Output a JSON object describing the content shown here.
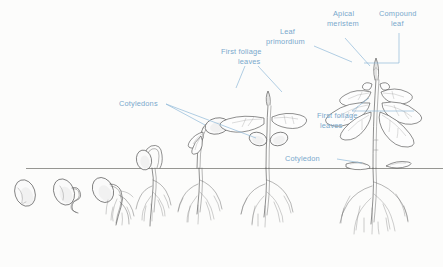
{
  "figure": {
    "background_color": "#fcfcfb",
    "ink_color": "#4a4a4a",
    "label_color": "#79a8cc",
    "soil_line_color": "#8a8a86",
    "soil_line_y": 168
  },
  "labels": {
    "cotyledons_plural": "Cotyledons",
    "first_foliage_leaves_top": "First foliage\nleaves",
    "first_foliage_leaves_top_line1": "First foliage",
    "first_foliage_leaves_top_line2": "leaves",
    "leaf_primordium_line1": "Leaf",
    "leaf_primordium_line2": "primordium",
    "apical_meristem_line1": "Apical",
    "apical_meristem_line2": "meristem",
    "compound_leaf_line1": "Compound",
    "compound_leaf_line2": "leaf",
    "first_foliage_leaves_lower_line1": "First foliage",
    "first_foliage_leaves_lower_line2": "leaves",
    "cotyledon_singular": "Cotyledon"
  },
  "stages": [
    {
      "index": 1,
      "name": "dormant-seed",
      "center_x": 25,
      "description": "Dormant bean seed below soil"
    },
    {
      "index": 2,
      "name": "radicle-emergence",
      "center_x": 65,
      "description": "Seed with emerging radicle"
    },
    {
      "index": 3,
      "name": "root-development",
      "center_x": 106,
      "description": "Seed with branching primary root"
    },
    {
      "index": 4,
      "name": "hypocotyl-arch",
      "center_x": 150,
      "description": "Hypocotyl arch breaking soil surface"
    },
    {
      "index": 5,
      "name": "cotyledon-emergence",
      "center_x": 200,
      "description": "Cotyledons raised above soil on hypocotyl"
    },
    {
      "index": 6,
      "name": "first-foliage-leaves",
      "center_x": 268,
      "description": "First foliage leaves expanded, cotyledons present"
    },
    {
      "index": 7,
      "name": "compound-leaf-seedling",
      "center_x": 375,
      "description": "Mature seedling with compound leaves, cotyledons shed"
    }
  ]
}
